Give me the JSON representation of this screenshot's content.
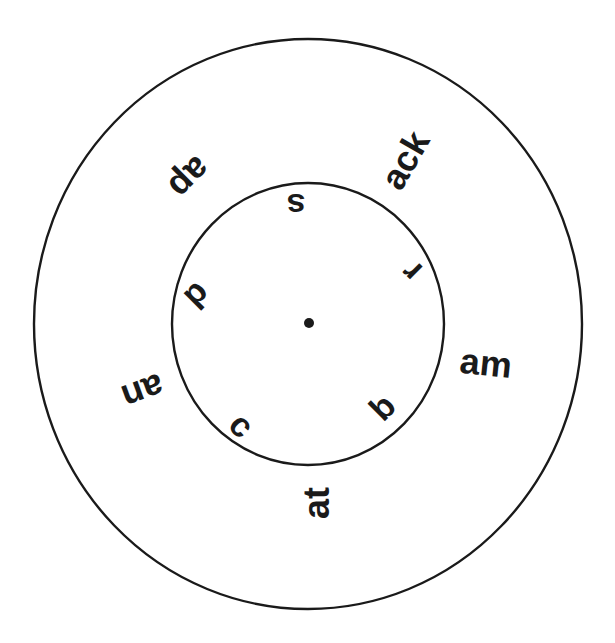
{
  "diagram": {
    "title": "",
    "stroke_color": "#1a1a1a",
    "background": "#ffffff",
    "outer_circle": {
      "cx": 308,
      "cy": 324,
      "rx": 274,
      "ry": 285
    },
    "inner_circle": {
      "cx": 308,
      "cy": 324,
      "rx": 136,
      "ry": 141
    },
    "center_dot": {
      "cx": 309,
      "cy": 323,
      "r": 5
    },
    "inner_letters": [
      {
        "id": "s",
        "text": "s",
        "x": 296,
        "y": 206,
        "rotate": 180,
        "size": 34
      },
      {
        "id": "r",
        "text": "r",
        "x": 411,
        "y": 272,
        "rotate": -135,
        "size": 34
      },
      {
        "id": "b",
        "text": "b",
        "x": 382,
        "y": 407,
        "rotate": -45,
        "size": 34
      },
      {
        "id": "c",
        "text": "c",
        "x": 242,
        "y": 425,
        "rotate": 45,
        "size": 34
      },
      {
        "id": "d",
        "text": "d",
        "x": 198,
        "y": 296,
        "rotate": 135,
        "size": 34
      }
    ],
    "outer_endings": [
      {
        "id": "ap",
        "text": "ap",
        "x": 190,
        "y": 178,
        "rotate": 135,
        "size": 36
      },
      {
        "id": "ack",
        "text": "ack",
        "x": 405,
        "y": 160,
        "rotate": -60,
        "size": 36
      },
      {
        "id": "am",
        "text": "am",
        "x": 486,
        "y": 363,
        "rotate": 6,
        "size": 36
      },
      {
        "id": "at",
        "text": "at",
        "x": 316,
        "y": 503,
        "rotate": -90,
        "size": 36
      },
      {
        "id": "an",
        "text": "an",
        "x": 143,
        "y": 392,
        "rotate": 160,
        "size": 36
      }
    ]
  }
}
